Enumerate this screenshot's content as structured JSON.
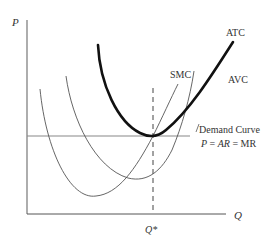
{
  "diagram": {
    "type": "economics-cost-curves",
    "axes": {
      "y_label": "P",
      "x_label": "Q",
      "x_marker_label": "Q*"
    },
    "curves": {
      "atc": {
        "label": "ATC"
      },
      "avc": {
        "label": "AVC"
      },
      "smc": {
        "label": "SMC"
      },
      "demand": {
        "label_line1": "Demand Curve",
        "label_line2_p": "P",
        "label_line2_eq1": " = ",
        "label_line2_ar": "AR",
        "label_line2_eq2": " = MR"
      }
    },
    "colors": {
      "axis": "#555555",
      "thin_curve": "#555555",
      "atc_curve": "#111111",
      "demand_line": "#777777",
      "text": "#333333"
    }
  }
}
